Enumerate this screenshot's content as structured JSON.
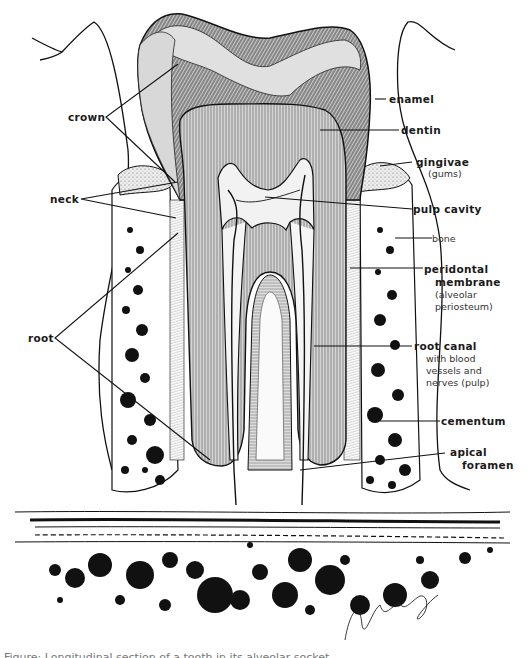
{
  "figure": {
    "colors": {
      "ink": "#111111",
      "enamel_fill": "#d9d9d9",
      "dentin_fill": "#cfcfcf",
      "paper": "#ffffff"
    }
  },
  "labels_left": [
    {
      "id": "crown",
      "text": "crown"
    },
    {
      "id": "neck",
      "text": "neck"
    },
    {
      "id": "root",
      "text": "root"
    }
  ],
  "labels_right": [
    {
      "id": "enamel",
      "text": "enamel"
    },
    {
      "id": "dentin",
      "text": "dentin"
    },
    {
      "id": "gingivae",
      "text": "gingivae",
      "sub": [
        "(gums)"
      ]
    },
    {
      "id": "pulp-cavity",
      "text": "pulp cavity"
    },
    {
      "id": "bone",
      "text": "bone"
    },
    {
      "id": "peridontal",
      "text": "peridontal",
      "text2": "membrane",
      "sub": [
        "(alveolar",
        "periosteum)"
      ]
    },
    {
      "id": "root-canal",
      "text": "root canal",
      "sub": [
        "with blood",
        "vessels and",
        "nerves (pulp)"
      ]
    },
    {
      "id": "cementum",
      "text": "cementum"
    },
    {
      "id": "apical-foramen",
      "text": "apical",
      "text2": "foramen"
    }
  ],
  "signature": "Joe Juhasz",
  "caption_partial": "Figure: Longitudinal section of a tooth in its alveolar socket"
}
